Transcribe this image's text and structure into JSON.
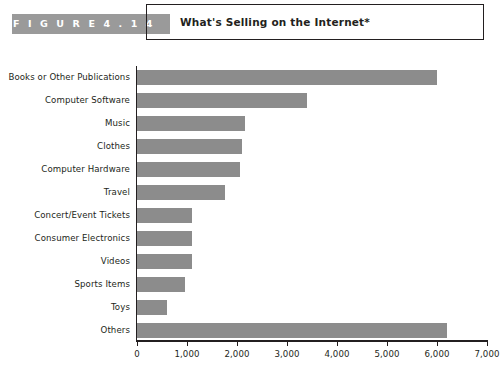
{
  "header": {
    "figure_tag": "F I G U R E   4 . 1 4",
    "title": "What's Selling on the Internet*",
    "accent_color": "#9a9a9a",
    "border_color": "#231f20"
  },
  "chart_data": {
    "type": "bar",
    "orientation": "horizontal",
    "title": "What's Selling on the Internet*",
    "xlabel": "",
    "ylabel": "",
    "xlim": [
      0,
      7000
    ],
    "grid": false,
    "legend": null,
    "bar_color": "#8c8c8c",
    "xticks": [
      0,
      1000,
      2000,
      3000,
      4000,
      5000,
      6000,
      7000
    ],
    "xtick_labels": [
      "0",
      "1,000",
      "2,000",
      "3,000",
      "4,000",
      "5,000",
      "6,000",
      "7,000"
    ],
    "categories": [
      "Books or Other Publications",
      "Computer Software",
      "Music",
      "Clothes",
      "Computer Hardware",
      "Travel",
      "Concert/Event Tickets",
      "Consumer Electronics",
      "Videos",
      "Sports Items",
      "Toys",
      "Others"
    ],
    "values": [
      6000,
      3400,
      2150,
      2100,
      2050,
      1750,
      1100,
      1100,
      1100,
      950,
      600,
      6200
    ]
  }
}
